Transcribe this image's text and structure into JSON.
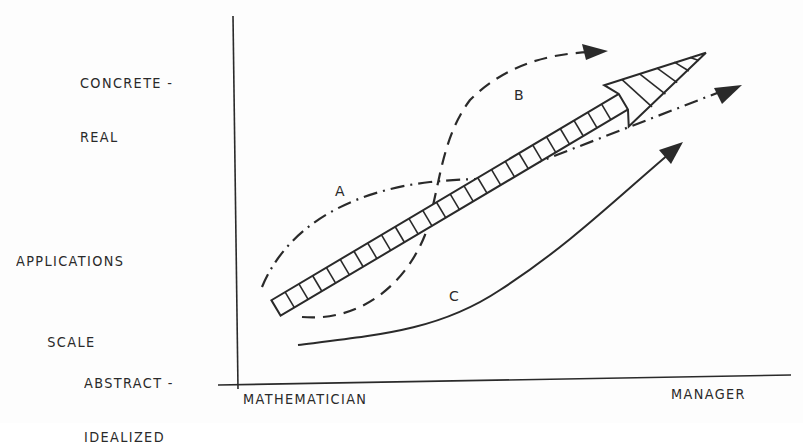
{
  "diagram": {
    "y_axis": {
      "title_line1": "APPLICATIONS",
      "title_line2": "SCALE",
      "top_label_line1": "CONCRETE -",
      "top_label_line2": "REAL",
      "bottom_label_line1": "ABSTRACT -",
      "bottom_label_line2": "IDEALIZED"
    },
    "x_axis": {
      "left_label": "MATHEMATICIAN",
      "right_label": "MANAGER"
    },
    "paths": [
      {
        "id": "main",
        "label": "",
        "style": "hatched-arrow",
        "description": "broad hatched arrow from abstract/mathematician to concrete/manager"
      },
      {
        "id": "A",
        "label": "A",
        "style": "dash-dot"
      },
      {
        "id": "B",
        "label": "B",
        "style": "dashed"
      },
      {
        "id": "C",
        "label": "C",
        "style": "solid"
      }
    ],
    "colors": {
      "ink": "#2a2a2a",
      "paper": "#fdfdfd"
    }
  }
}
